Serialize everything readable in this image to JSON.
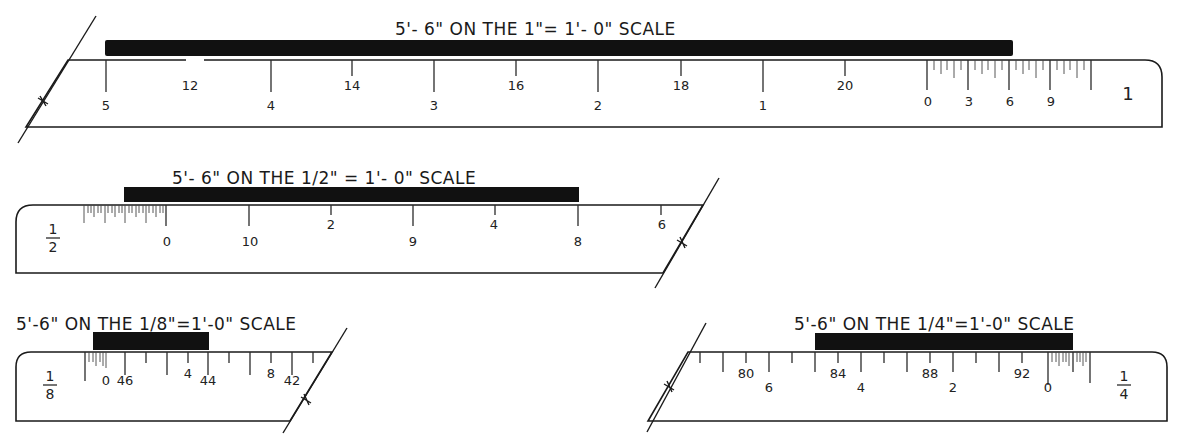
{
  "rulers": [
    {
      "id": "scale-1in",
      "title": "5'-6\" ON THE 1\"= 1'-0\" SCALE",
      "scale_label": "1",
      "primary_labels": [
        "5",
        "4",
        "3",
        "2",
        "1",
        "0",
        "3",
        "6",
        "9"
      ],
      "secondary_labels": [
        "12",
        "14",
        "16",
        "18",
        "20"
      ],
      "measurement": "5'-6\""
    },
    {
      "id": "scale-half-in",
      "title": "5'-6\" ON THE 1/2\" = 1'-0\" SCALE",
      "scale_label_num": "1",
      "scale_label_den": "2",
      "primary_labels": [
        "0",
        "10",
        "9",
        "8"
      ],
      "secondary_labels": [
        "2",
        "4",
        "6"
      ],
      "measurement": "5'-6\""
    },
    {
      "id": "scale-eighth-in",
      "title": "5'-6\" ON THE 1/8\"=1'-0\" SCALE",
      "scale_label_num": "1",
      "scale_label_den": "8",
      "primary_labels": [
        "0",
        "46",
        "44",
        "42"
      ],
      "secondary_labels": [
        "4",
        "8"
      ],
      "measurement": "5'-6\""
    },
    {
      "id": "scale-quarter-in",
      "title": "5'-6\" ON THE 1/4\"=1'-0\" SCALE",
      "scale_label_num": "1",
      "scale_label_den": "4",
      "primary_labels": [
        "6",
        "4",
        "2",
        "0"
      ],
      "secondary_labels": [
        "80",
        "84",
        "88",
        "92"
      ],
      "measurement": "5'-6\""
    }
  ],
  "labels": {
    "r1": {
      "title": "5'- 6\" ON THE 1\"= 1'- 0\" SCALE",
      "p5": "5",
      "p4": "4",
      "p3": "3",
      "p2": "2",
      "p1": "1",
      "p0": "0",
      "i3": "3",
      "i6": "6",
      "i9": "9",
      "s12": "12",
      "s14": "14",
      "s16": "16",
      "s18": "18",
      "s20": "20",
      "scale": "1"
    },
    "r2": {
      "title": "5'- 6\" ON THE 1/2\" = 1'- 0\" SCALE",
      "p0": "0",
      "p10": "10",
      "p9": "9",
      "p8": "8",
      "s2": "2",
      "s4": "4",
      "s6": "6",
      "num": "1",
      "den": "2"
    },
    "r3": {
      "title": "5'-6\" ON THE 1/8\"=1'-0\" SCALE",
      "p0": "0",
      "p46": "46",
      "p44": "44",
      "p42": "42",
      "s4": "4",
      "s8": "8",
      "num": "1",
      "den": "8"
    },
    "r4": {
      "title": "5'-6\" ON THE 1/4\"=1'-0\" SCALE",
      "p6": "6",
      "p4": "4",
      "p2": "2",
      "p0": "0",
      "s80": "80",
      "s84": "84",
      "s88": "88",
      "s92": "92",
      "num": "1",
      "den": "4"
    }
  }
}
